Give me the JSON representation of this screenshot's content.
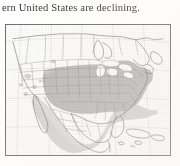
{
  "page": {
    "kind": "scanned-book-page-fragment",
    "background_color": "#ffffff",
    "text_color": "#201c1a"
  },
  "body_text": {
    "line": "ern United States are declining."
  },
  "figure": {
    "name": "north-america-range-map",
    "frame_color": "#6e6a67",
    "ocean_color": "#fdfdfc",
    "graticule_color": "#c9c6c2",
    "coast_color": "#6b6764",
    "state_border_color": "#817d79",
    "shaded_range_color": "#b7b7b5",
    "light_range_color": "#d3d2cf",
    "faint_patch_color": "#cfcecb",
    "caption": "",
    "legend": [],
    "regions_shaded": [
      "Eastern United States",
      "Central United States",
      "Great Plains",
      "Southeastern United States",
      "Mid-Atlantic",
      "Mexico",
      "Cuba",
      "Hispaniola",
      "Caribbean islands"
    ],
    "regions_unshaded": [
      "Pacific Northwest",
      "Great Basin",
      "California",
      "Canada"
    ]
  }
}
